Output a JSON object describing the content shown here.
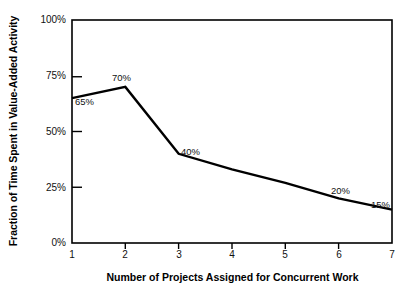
{
  "chart_data": {
    "type": "line",
    "title": "",
    "xlabel": "Number of Projects Assigned for Concurrent Work",
    "ylabel": "Fraction of Time Spent in Value-Added Activity",
    "x": [
      1,
      2,
      3,
      4,
      5,
      6,
      7
    ],
    "values": [
      65,
      70,
      40,
      33,
      27,
      20,
      15
    ],
    "categories": [
      "1",
      "2",
      "3",
      "4",
      "5",
      "6",
      "7"
    ],
    "xlim": [
      1,
      7
    ],
    "ylim": [
      0,
      100
    ],
    "grid": false,
    "legend": false,
    "line_color": "#000000",
    "background_color": "#ffffff",
    "yticks": [
      {
        "value": 100,
        "label": "100%"
      },
      {
        "value": 75,
        "label": "75%"
      },
      {
        "value": 50,
        "label": "50%"
      },
      {
        "value": 25,
        "label": "25%"
      },
      {
        "value": 0,
        "label": "0%"
      }
    ],
    "xticks": [
      {
        "value": 1,
        "label": "1"
      },
      {
        "value": 2,
        "label": "2"
      },
      {
        "value": 3,
        "label": "3"
      },
      {
        "value": 4,
        "label": "4"
      },
      {
        "value": 5,
        "label": "5"
      },
      {
        "value": 6,
        "label": "6"
      },
      {
        "value": 7,
        "label": "7"
      }
    ],
    "point_labels": [
      {
        "x": 1,
        "y": 65,
        "text": "65%"
      },
      {
        "x": 2,
        "y": 70,
        "text": "70%"
      },
      {
        "x": 3,
        "y": 40,
        "text": "40%"
      },
      {
        "x": 6,
        "y": 20,
        "text": "20%"
      },
      {
        "x": 7,
        "y": 15,
        "text": "15%"
      }
    ]
  }
}
